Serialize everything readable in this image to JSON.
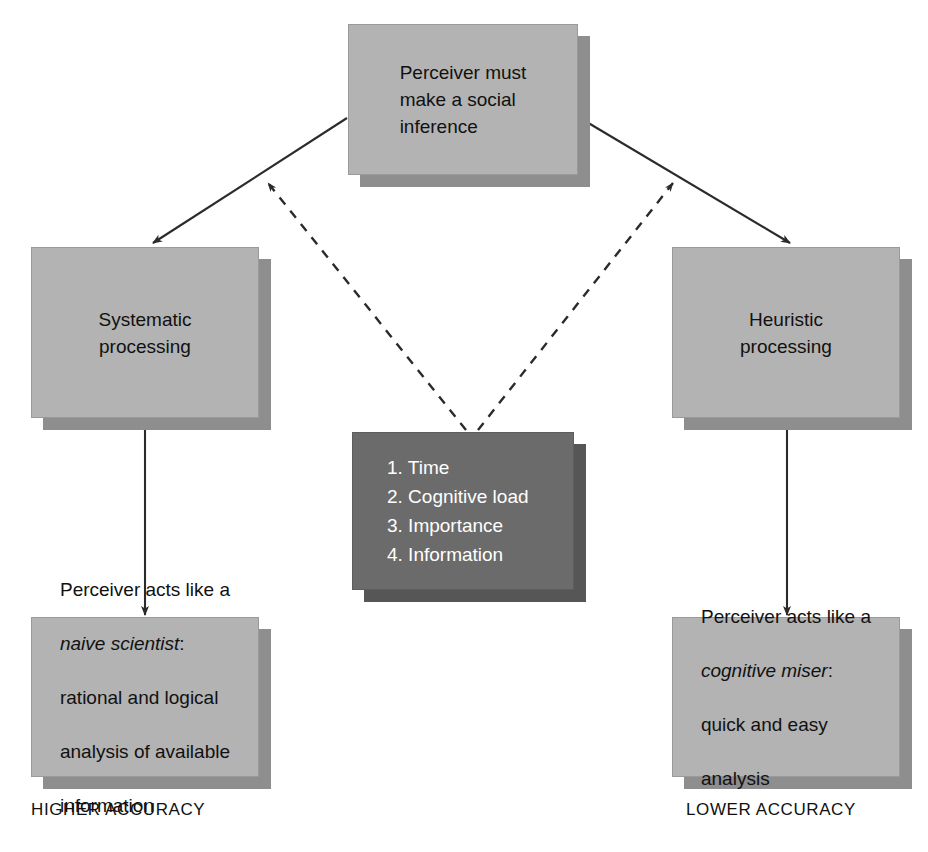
{
  "diagram": {
    "colors": {
      "box_fill": "#b3b3b3",
      "box_shadow": "#8e8e8e",
      "dark_box_fill": "#6b6b6b",
      "dark_box_shadow": "#565656",
      "text": "#111111",
      "dark_box_text": "#ffffff",
      "arrow": "#2b2b2b",
      "background": "#ffffff"
    },
    "nodes": {
      "top": {
        "id": "perceiver-must-make-social-inference",
        "text": "Perceiver must\nmake a social\ninference",
        "style": "light"
      },
      "left": {
        "id": "systematic-processing",
        "text": "Systematic\nprocessing",
        "style": "light"
      },
      "right": {
        "id": "heuristic-processing",
        "text": "Heuristic\nprocessing",
        "style": "light"
      },
      "center": {
        "id": "moderating-factors",
        "style": "dark",
        "items": [
          "1. Time",
          "2. Cognitive load",
          "3. Importance",
          "4. Information"
        ]
      },
      "bottom_left": {
        "id": "naive-scientist-outcome",
        "style": "light",
        "line1": "Perceiver acts like a",
        "line2_italic": "naive scientist",
        "line2_suffix": ":",
        "line3": "rational and logical",
        "line4": "analysis of available",
        "line5": "information"
      },
      "bottom_right": {
        "id": "cognitive-miser-outcome",
        "style": "light",
        "line1": "Perceiver acts like a",
        "line2_italic": "cognitive miser",
        "line2_suffix": ":",
        "line3": "quick and easy",
        "line4": "analysis"
      }
    },
    "captions": {
      "left": "HIGHER ACCURACY",
      "right": "LOWER ACCURACY"
    },
    "edges": [
      {
        "id": "top-to-systematic",
        "from": "top",
        "to": "left",
        "style": "solid",
        "arrowhead": "end"
      },
      {
        "id": "top-to-heuristic",
        "from": "top",
        "to": "right",
        "style": "solid",
        "arrowhead": "end"
      },
      {
        "id": "factors-to-left-path",
        "from": "center",
        "to": "top-to-systematic",
        "style": "dashed",
        "arrowhead": "end"
      },
      {
        "id": "factors-to-right-path",
        "from": "center",
        "to": "top-to-heuristic",
        "style": "dashed",
        "arrowhead": "end"
      },
      {
        "id": "systematic-to-naive-scientist",
        "from": "left",
        "to": "bottom_left",
        "style": "solid",
        "arrowhead": "end"
      },
      {
        "id": "heuristic-to-cognitive-miser",
        "from": "right",
        "to": "bottom_right",
        "style": "solid",
        "arrowhead": "end"
      }
    ]
  }
}
